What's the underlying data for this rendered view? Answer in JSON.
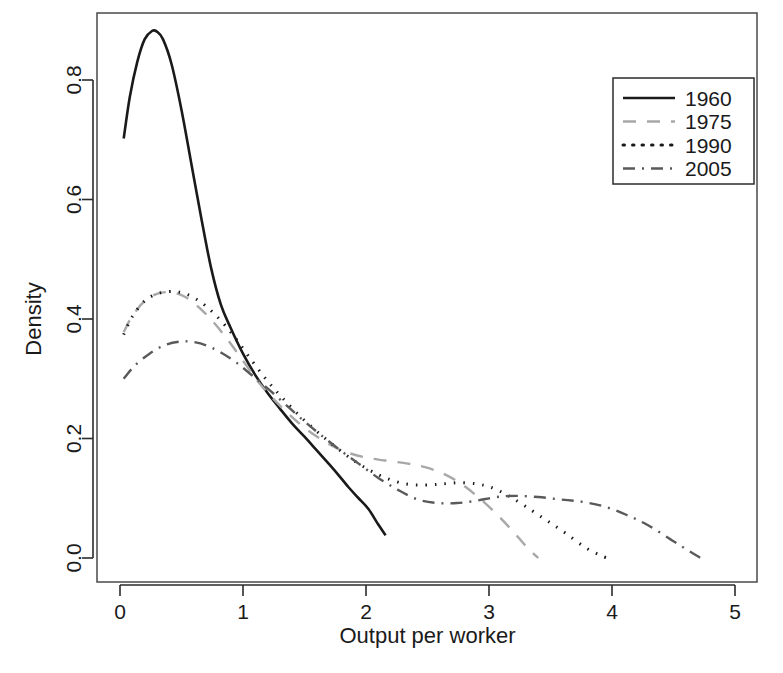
{
  "chart_data": {
    "type": "line",
    "title": "",
    "xlabel": "Output per worker",
    "ylabel": "Density",
    "xlim": [
      -0.12,
      5.2
    ],
    "ylim": [
      -0.02,
      0.93
    ],
    "xticks": [
      0,
      1,
      2,
      3,
      4,
      5
    ],
    "xtick_labels": [
      "0",
      "1",
      "2",
      "3",
      "4",
      "5"
    ],
    "yticks": [
      0.0,
      0.2,
      0.4,
      0.6,
      0.8
    ],
    "ytick_labels": [
      "0.0",
      "0.2",
      "0.4",
      "0.6",
      "0.8"
    ],
    "grid": false,
    "legend_position": "top-right",
    "series": [
      {
        "name": "1960",
        "style": "solid",
        "color": "#1a1a1a",
        "width": 2.6,
        "dasharray": "",
        "x": [
          0.03,
          0.08,
          0.14,
          0.2,
          0.26,
          0.3,
          0.35,
          0.42,
          0.5,
          0.58,
          0.66,
          0.74,
          0.82,
          0.9,
          1.0,
          1.1,
          1.2,
          1.3,
          1.4,
          1.5,
          1.6,
          1.7,
          1.78,
          1.86,
          1.94,
          2.02,
          2.1,
          2.16
        ],
        "y": [
          0.702,
          0.772,
          0.83,
          0.868,
          0.882,
          0.881,
          0.868,
          0.826,
          0.75,
          0.66,
          0.57,
          0.486,
          0.424,
          0.385,
          0.342,
          0.306,
          0.276,
          0.25,
          0.225,
          0.203,
          0.18,
          0.157,
          0.138,
          0.118,
          0.1,
          0.082,
          0.056,
          0.038
        ]
      },
      {
        "name": "1975",
        "style": "dashed",
        "color": "#a8a8a8",
        "width": 2.4,
        "dasharray": "13 11",
        "x": [
          0.03,
          0.1,
          0.2,
          0.3,
          0.4,
          0.5,
          0.58,
          0.68,
          0.78,
          0.88,
          1.0,
          1.12,
          1.24,
          1.36,
          1.5,
          1.64,
          1.78,
          1.92,
          2.06,
          2.2,
          2.34,
          2.48,
          2.62,
          2.76,
          2.9,
          3.04,
          3.18,
          3.3,
          3.4
        ],
        "y": [
          0.378,
          0.405,
          0.43,
          0.442,
          0.445,
          0.44,
          0.43,
          0.412,
          0.39,
          0.364,
          0.33,
          0.296,
          0.268,
          0.243,
          0.218,
          0.198,
          0.182,
          0.172,
          0.166,
          0.162,
          0.158,
          0.152,
          0.142,
          0.126,
          0.104,
          0.078,
          0.048,
          0.02,
          0.0
        ]
      },
      {
        "name": "1990",
        "style": "dotted",
        "color": "#1a1a1a",
        "width": 3.0,
        "dasharray": "1.5 8",
        "x": [
          0.03,
          0.1,
          0.2,
          0.3,
          0.4,
          0.48,
          0.56,
          0.66,
          0.76,
          0.86,
          0.96,
          1.08,
          1.2,
          1.32,
          1.46,
          1.6,
          1.74,
          1.88,
          2.02,
          2.16,
          2.32,
          2.48,
          2.62,
          2.76,
          2.9,
          3.02,
          3.16,
          3.3,
          3.46,
          3.62,
          3.78,
          3.9,
          3.96
        ],
        "y": [
          0.374,
          0.404,
          0.43,
          0.442,
          0.446,
          0.445,
          0.44,
          0.428,
          0.41,
          0.388,
          0.362,
          0.328,
          0.296,
          0.268,
          0.238,
          0.212,
          0.188,
          0.166,
          0.148,
          0.134,
          0.124,
          0.122,
          0.124,
          0.126,
          0.124,
          0.118,
          0.104,
          0.086,
          0.064,
          0.042,
          0.018,
          0.005,
          0.0
        ]
      },
      {
        "name": "2005",
        "style": "dashdot",
        "color": "#5a5a5a",
        "width": 2.4,
        "dasharray": "12 7 2 7",
        "x": [
          0.03,
          0.12,
          0.24,
          0.36,
          0.48,
          0.58,
          0.7,
          0.82,
          0.94,
          1.06,
          1.2,
          1.34,
          1.48,
          1.62,
          1.78,
          1.94,
          2.1,
          2.26,
          2.42,
          2.58,
          2.74,
          2.9,
          3.06,
          3.22,
          3.4,
          3.58,
          3.76,
          3.94,
          4.12,
          4.3,
          4.5,
          4.64,
          4.72
        ],
        "y": [
          0.3,
          0.322,
          0.342,
          0.356,
          0.362,
          0.362,
          0.356,
          0.344,
          0.328,
          0.308,
          0.284,
          0.258,
          0.232,
          0.208,
          0.182,
          0.158,
          0.134,
          0.114,
          0.098,
          0.092,
          0.092,
          0.096,
          0.102,
          0.104,
          0.102,
          0.098,
          0.094,
          0.086,
          0.072,
          0.054,
          0.028,
          0.01,
          0.0
        ]
      }
    ]
  },
  "legend": {
    "items": [
      {
        "label": "1960"
      },
      {
        "label": "1975"
      },
      {
        "label": "1990"
      },
      {
        "label": "2005"
      }
    ]
  }
}
